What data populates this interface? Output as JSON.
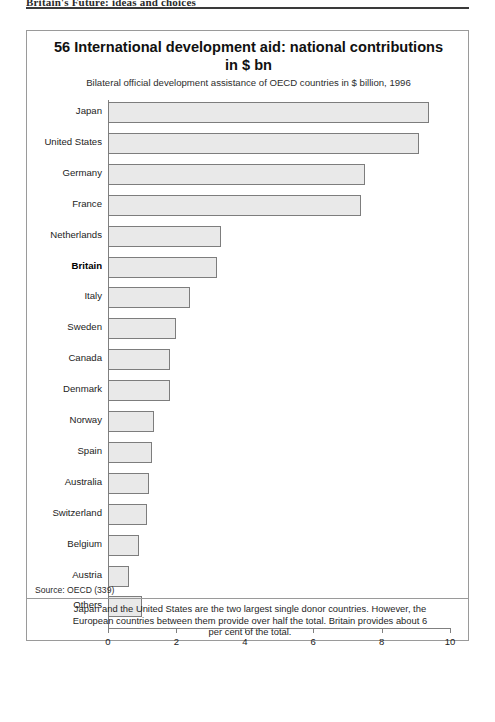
{
  "page_header": {
    "text": "Britain's Future: ideas and choices"
  },
  "figure": {
    "number_and_title": "56 International development aid: national contributions in $ bn",
    "subtitle": "Bilateral official development assistance of OECD countries in $ billion, 1996",
    "source": "Source: OECD (339)",
    "caption": "Japan and the United States are the two largest single donor countries. However, the European countries between them provide over half the total. Britain provides about 6 per cent of the total.",
    "colors": {
      "bar_fill": "#e9e9e9",
      "bar_border": "#7d7d7d",
      "frame": "#9a9a9a",
      "axis": "#808080",
      "text": "#1a1a1a"
    }
  },
  "chart_data": {
    "type": "bar",
    "orientation": "horizontal",
    "title": "56 International development aid: national contributions in $ bn",
    "subtitle": "Bilateral official development assistance of OECD countries in $ billion, 1996",
    "xlabel": "",
    "ylabel": "",
    "xlim": [
      0,
      10
    ],
    "xticks": [
      0,
      2,
      4,
      6,
      8,
      10
    ],
    "xtick_labels": [
      "0",
      "2",
      "4",
      "6",
      "8",
      "10"
    ],
    "grid": false,
    "legend": null,
    "highlight": "Britain",
    "categories": [
      "Japan",
      "United States",
      "Germany",
      "France",
      "Netherlands",
      "Britain",
      "Italy",
      "Sweden",
      "Canada",
      "Denmark",
      "Norway",
      "Spain",
      "Australia",
      "Switzerland",
      "Belgium",
      "Austria",
      "Others"
    ],
    "values": [
      9.4,
      9.1,
      7.5,
      7.4,
      3.3,
      3.2,
      2.4,
      2.0,
      1.8,
      1.8,
      1.35,
      1.3,
      1.2,
      1.15,
      0.9,
      0.6,
      1.0
    ],
    "units": "$ billion"
  }
}
